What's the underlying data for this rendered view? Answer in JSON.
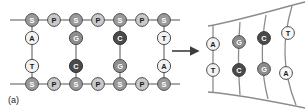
{
  "figure": {
    "label": "(a)",
    "arrow": "right-arrow",
    "colors": {
      "sugar": "#9a9a9a",
      "phosphate": "#c9c9c9",
      "base_light": "#f2f2f2",
      "base_mid": "#8d8d8d",
      "base_dark": "#4a4a4a",
      "stroke": "#4d4d4d",
      "backbone": "#8c8c8c",
      "text_dark": "#1a1a1a"
    }
  },
  "ladder": {
    "top_backbone": [
      {
        "label": "S",
        "kind": "sugar",
        "cx": 32,
        "cy": 20
      },
      {
        "label": "P",
        "kind": "phosphate",
        "cx": 54,
        "cy": 20
      },
      {
        "label": "S",
        "kind": "sugar",
        "cx": 76,
        "cy": 20
      },
      {
        "label": "P",
        "kind": "phosphate",
        "cx": 98,
        "cy": 20
      },
      {
        "label": "S",
        "kind": "sugar",
        "cx": 120,
        "cy": 20
      },
      {
        "label": "P",
        "kind": "phosphate",
        "cx": 142,
        "cy": 20
      },
      {
        "label": "S",
        "kind": "sugar",
        "cx": 164,
        "cy": 20
      }
    ],
    "bottom_backbone": [
      {
        "label": "S",
        "kind": "sugar",
        "cx": 32,
        "cy": 84
      },
      {
        "label": "P",
        "kind": "phosphate",
        "cx": 54,
        "cy": 84
      },
      {
        "label": "S",
        "kind": "sugar",
        "cx": 76,
        "cy": 84
      },
      {
        "label": "P",
        "kind": "phosphate",
        "cx": 98,
        "cy": 84
      },
      {
        "label": "S",
        "kind": "sugar",
        "cx": 120,
        "cy": 84
      },
      {
        "label": "P",
        "kind": "phosphate",
        "cx": 142,
        "cy": 84
      },
      {
        "label": "S",
        "kind": "sugar",
        "cx": 164,
        "cy": 84
      }
    ],
    "base_pairs": [
      {
        "upper": "A",
        "upper_shade": "base_light",
        "lower": "T",
        "lower_shade": "base_light",
        "cx": 32
      },
      {
        "upper": "G",
        "upper_shade": "base_mid",
        "lower": "C",
        "lower_shade": "base_dark",
        "cx": 76
      },
      {
        "upper": "C",
        "upper_shade": "base_dark",
        "lower": "G",
        "lower_shade": "base_mid",
        "cx": 120
      },
      {
        "upper": "T",
        "upper_shade": "base_light",
        "lower": "A",
        "lower_shade": "base_light",
        "cx": 164
      }
    ]
  },
  "helix": {
    "base_pairs": [
      {
        "upper": "A",
        "upper_shade": "base_light",
        "lower": "T",
        "lower_shade": "base_light"
      },
      {
        "upper": "G",
        "upper_shade": "base_mid",
        "lower": "C",
        "lower_shade": "base_dark"
      },
      {
        "upper": "C",
        "upper_shade": "base_dark",
        "lower": "G",
        "lower_shade": "base_mid"
      },
      {
        "upper": "T",
        "upper_shade": "base_light",
        "lower": "A",
        "lower_shade": "base_light"
      }
    ]
  }
}
